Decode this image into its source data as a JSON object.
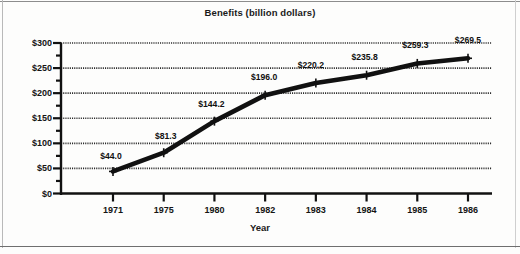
{
  "figure": {
    "title": "Benefits (billion dollars)",
    "xaxis_title": "Year",
    "background_color": "#fdfdfc",
    "line_color": "#111111",
    "gridline_color": "#2b2b2b"
  },
  "chart_data": {
    "type": "line",
    "title": "Benefits (billion dollars)",
    "xlabel": "Year",
    "ylabel": "",
    "categories": [
      "1971",
      "1975",
      "1980",
      "1982",
      "1983",
      "1984",
      "1985",
      "1986"
    ],
    "values": [
      44.0,
      81.3,
      144.2,
      196.0,
      220.2,
      235.8,
      259.3,
      269.5
    ],
    "point_labels": [
      "$44.0",
      "$81.3",
      "$144.2",
      "$196.0",
      "$220.2",
      "$235.8",
      "$259.3",
      "$269.5"
    ],
    "ylim": [
      0,
      300
    ],
    "ytick_values": [
      0,
      50,
      100,
      150,
      200,
      250,
      300
    ],
    "ytick_labels": [
      "$0",
      "$50",
      "$100",
      "$150",
      "$200",
      "$250",
      "$300"
    ],
    "yminor_tick_values": [
      25,
      75,
      125,
      175,
      225,
      275
    ],
    "grid": true,
    "grid_style": "dotted",
    "grid_axis": "y",
    "legend": false,
    "marker": "plus",
    "series": [
      {
        "name": "Benefits",
        "values": [
          44.0,
          81.3,
          144.2,
          196.0,
          220.2,
          235.8,
          259.3,
          269.5
        ]
      }
    ]
  }
}
